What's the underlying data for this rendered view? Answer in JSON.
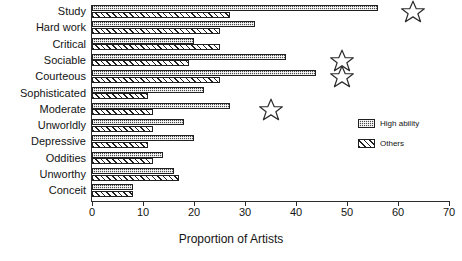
{
  "chart_data": {
    "type": "bar",
    "orientation": "horizontal",
    "title": "",
    "xlabel": "Proportion of Artists",
    "ylabel": "",
    "xlim": [
      0,
      70
    ],
    "xticks": [
      0,
      10,
      20,
      30,
      40,
      50,
      60,
      70
    ],
    "grid": false,
    "legend_position": "right",
    "categories": [
      "Study",
      "Hard work",
      "Critical",
      "Sociable",
      "Courteous",
      "Sophisticated",
      "Moderate",
      "Unworldly",
      "Depressive",
      "Oddities",
      "Unworthy",
      "Conceit"
    ],
    "series": [
      {
        "name": "High ability",
        "values": [
          56,
          32,
          20,
          38,
          44,
          22,
          27,
          18,
          20,
          14,
          16,
          8
        ]
      },
      {
        "name": "Others",
        "values": [
          27,
          25,
          25,
          19,
          25,
          11,
          12,
          12,
          11,
          12,
          17,
          8
        ]
      }
    ],
    "annotations": [
      {
        "marker": "star",
        "category": "Study",
        "x": 63
      },
      {
        "marker": "star",
        "category": "Sociable",
        "x": 49
      },
      {
        "marker": "star",
        "category": "Courteous",
        "x": 49
      },
      {
        "marker": "star",
        "category": "Moderate",
        "x": 35
      }
    ]
  },
  "legend": {
    "items": [
      {
        "label": "High ability",
        "pattern": "dotted-dark"
      },
      {
        "label": "Others",
        "pattern": "diagonal-hatch"
      }
    ]
  },
  "axis": {
    "x_title": "Proportion of Artists",
    "tick_labels": [
      "0",
      "10",
      "20",
      "30",
      "40",
      "50",
      "60",
      "70"
    ]
  },
  "colors": {
    "high_ability": "#4a4a4a",
    "others": "#ffffff",
    "outline": "#1f1f1f",
    "axis": "#2b2b2b",
    "text": "#141414",
    "background": "#ffffff"
  }
}
